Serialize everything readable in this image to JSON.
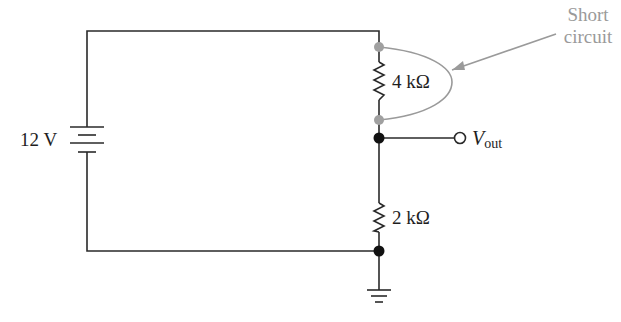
{
  "diagram": {
    "type": "electric-circuit-schematic",
    "source": {
      "label": "12 V",
      "kind": "dc-battery"
    },
    "resistors": [
      {
        "id": "R1",
        "label": "4 kΩ",
        "position": "upper"
      },
      {
        "id": "R2",
        "label": "2 kΩ",
        "position": "lower"
      }
    ],
    "output": {
      "symbol": "V",
      "subscript": "out"
    },
    "annotation": {
      "line1": "Short",
      "line2": "circuit"
    },
    "ground": "ground-symbol",
    "colors": {
      "wire": "#2a2a2a",
      "short_circuit": "#9a9a9a",
      "node": "#111111",
      "short_node": "#a0a0a0"
    }
  }
}
